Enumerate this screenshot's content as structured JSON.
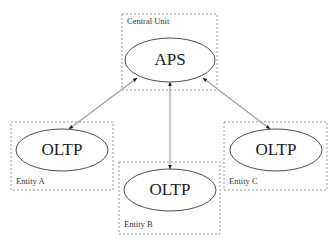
{
  "diagram": {
    "style": {
      "background": "#ffffff",
      "group_border": "#9a9a9a",
      "node_border": "#4d4d4d",
      "node_fill": "#ffffff",
      "link_color": "#9b9b9b",
      "text_color": "#1a1a1a"
    },
    "groups": [
      {
        "id": "central-unit",
        "label": "Central Unit",
        "x": 122,
        "y": 14,
        "width": 95,
        "height": 76,
        "label_x": 127,
        "label_y": 22
      },
      {
        "id": "entity-a",
        "label": "Entity A",
        "x": 11,
        "y": 122,
        "width": 102,
        "height": 68,
        "label_x": 16,
        "label_y": 182
      },
      {
        "id": "entity-b",
        "label": "Entity B",
        "x": 119,
        "y": 162,
        "width": 101,
        "height": 72,
        "label_x": 124,
        "label_y": 225
      },
      {
        "id": "entity-c",
        "label": "Entity C",
        "x": 224,
        "y": 122,
        "width": 103,
        "height": 68,
        "label_x": 229,
        "label_y": 182
      }
    ],
    "nodes": [
      {
        "id": "aps",
        "label": "APS",
        "cx": 170,
        "cy": 60,
        "rx": 45,
        "ry": 22
      },
      {
        "id": "oltp-a",
        "label": "OLTP",
        "cx": 62,
        "cy": 150,
        "rx": 46,
        "ry": 21
      },
      {
        "id": "oltp-b",
        "label": "OLTP",
        "cx": 170,
        "cy": 190,
        "rx": 46,
        "ry": 21
      },
      {
        "id": "oltp-c",
        "label": "OLTP",
        "cx": 276,
        "cy": 150,
        "rx": 46,
        "ry": 21
      }
    ],
    "links": [
      {
        "id": "link-aps-oltp-a",
        "from": "aps",
        "to": "oltp-a",
        "direction": "bidirectional",
        "x1": 137,
        "y1": 78,
        "x2": 69,
        "y2": 129
      },
      {
        "id": "link-aps-oltp-b",
        "from": "aps",
        "to": "oltp-b",
        "direction": "bidirectional",
        "x1": 170,
        "y1": 82,
        "x2": 170,
        "y2": 169
      },
      {
        "id": "link-aps-oltp-c",
        "from": "aps",
        "to": "oltp-c",
        "direction": "bidirectional",
        "x1": 203,
        "y1": 78,
        "x2": 270,
        "y2": 129
      }
    ]
  }
}
